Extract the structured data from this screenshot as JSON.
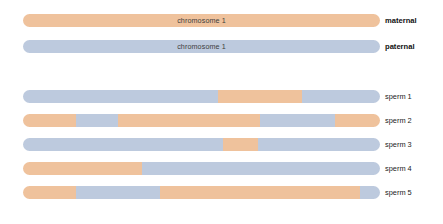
{
  "figure": {
    "colors": {
      "maternal": "#efc29c",
      "paternal": "#bdcade",
      "background": "#ffffff",
      "text": "#222222",
      "inner_text": "#3d3d3d"
    },
    "legend_terms": {
      "maternal": "maternal",
      "paternal": "paternal"
    },
    "parents": [
      {
        "id": "maternal-chromosome",
        "inner_label": "chromosome 1",
        "side_label": "maternal",
        "origin": "maternal",
        "segments": [
          {
            "origin": "maternal",
            "start_pct": 0,
            "end_pct": 100
          }
        ]
      },
      {
        "id": "paternal-chromosome",
        "inner_label": "chromosome 1",
        "side_label": "paternal",
        "origin": "paternal",
        "segments": [
          {
            "origin": "paternal",
            "start_pct": 0,
            "end_pct": 100
          }
        ]
      }
    ],
    "sperm": [
      {
        "id": "sperm-1",
        "side_label": "sperm 1",
        "crossovers": 2,
        "segments": [
          {
            "origin": "paternal",
            "start_pct": 0,
            "end_pct": 54.6
          },
          {
            "origin": "maternal",
            "start_pct": 54.6,
            "end_pct": 78.2
          },
          {
            "origin": "paternal",
            "start_pct": 78.2,
            "end_pct": 100
          }
        ]
      },
      {
        "id": "sperm-2",
        "side_label": "sperm 2",
        "crossovers": 4,
        "segments": [
          {
            "origin": "maternal",
            "start_pct": 0,
            "end_pct": 14.8
          },
          {
            "origin": "paternal",
            "start_pct": 14.8,
            "end_pct": 26.6
          },
          {
            "origin": "maternal",
            "start_pct": 26.6,
            "end_pct": 66.4
          },
          {
            "origin": "paternal",
            "start_pct": 66.4,
            "end_pct": 87.4
          },
          {
            "origin": "maternal",
            "start_pct": 87.4,
            "end_pct": 100
          }
        ]
      },
      {
        "id": "sperm-3",
        "side_label": "sperm 3",
        "crossovers": 2,
        "segments": [
          {
            "origin": "paternal",
            "start_pct": 0,
            "end_pct": 56.0
          },
          {
            "origin": "maternal",
            "start_pct": 56.0,
            "end_pct": 65.8
          },
          {
            "origin": "paternal",
            "start_pct": 65.8,
            "end_pct": 100
          }
        ]
      },
      {
        "id": "sperm-4",
        "side_label": "sperm 4",
        "crossovers": 1,
        "segments": [
          {
            "origin": "maternal",
            "start_pct": 0,
            "end_pct": 33.3
          },
          {
            "origin": "paternal",
            "start_pct": 33.3,
            "end_pct": 100
          }
        ]
      },
      {
        "id": "sperm-5",
        "side_label": "sperm 5",
        "crossovers": 3,
        "segments": [
          {
            "origin": "maternal",
            "start_pct": 0,
            "end_pct": 14.8
          },
          {
            "origin": "paternal",
            "start_pct": 14.8,
            "end_pct": 38.4
          },
          {
            "origin": "maternal",
            "start_pct": 38.4,
            "end_pct": 94.4
          },
          {
            "origin": "paternal",
            "start_pct": 94.4,
            "end_pct": 100
          }
        ]
      }
    ],
    "layout": {
      "bar_left_px": 23,
      "bar_width_px": 357,
      "bar_height_px": 13,
      "label_left_px": 385,
      "parent_row_tops_px": [
        14,
        40
      ],
      "sperm_row_tops_px": [
        90,
        114,
        138,
        162,
        186
      ]
    }
  }
}
